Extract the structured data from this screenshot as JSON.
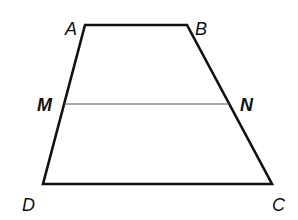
{
  "diagram": {
    "type": "trapezoid",
    "vertices": {
      "A": [
        85,
        25
      ],
      "B": [
        187,
        25
      ],
      "C": [
        272,
        184
      ],
      "D": [
        43,
        184
      ]
    },
    "midsegment": {
      "M": [
        64,
        104
      ],
      "N": [
        229,
        104
      ]
    },
    "labels": {
      "A": "A",
      "B": "B",
      "C": "C",
      "D": "D",
      "M": "M",
      "N": "N"
    },
    "colors": {
      "stroke": "#111111",
      "midsegment": "#555555"
    }
  }
}
